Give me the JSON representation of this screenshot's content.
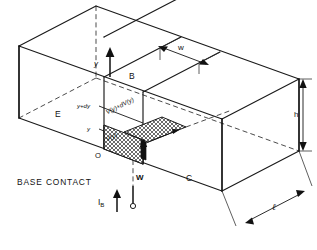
{
  "figure": {
    "caption": "BASE CONTACT",
    "line_color": "#1a1a1a",
    "background": "#ffffff"
  },
  "regions": [
    {
      "id": "emitter",
      "label": "E",
      "name": "region-label-emitter"
    },
    {
      "id": "base",
      "label": "B",
      "name": "region-label-base"
    },
    {
      "id": "collector",
      "label": "C",
      "name": "region-label-collector"
    }
  ],
  "axes": {
    "vertical_axis_label": "y",
    "origin_label": "O"
  },
  "dimensions": [
    {
      "id": "width",
      "label": "w",
      "name": "dimension-w"
    },
    {
      "id": "height",
      "label": "h",
      "name": "dimension-h"
    },
    {
      "id": "length",
      "label": "ℓ",
      "name": "dimension-l"
    }
  ],
  "annotations": {
    "y_lower": "y",
    "y_upper": "y+dy",
    "voltage_lower": "V(y)",
    "voltage_upper": "V(y)+dV(y)",
    "slab_width": "W"
  },
  "terminal": {
    "current_symbol": "I",
    "current_subscript": "B",
    "current_direction": "up"
  }
}
